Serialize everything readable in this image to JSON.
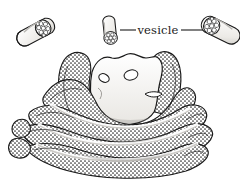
{
  "figure": {
    "style": "stippled pen-and-ink scientific illustration",
    "background_color": "#ffffff",
    "ink_color": "#1a1a1a",
    "width": 240,
    "height": 179
  },
  "labels": [
    {
      "id": "vesicle-label",
      "text": "vesicle",
      "x": 158,
      "y": 33,
      "leader_left": {
        "x1": 120,
        "y1": 30,
        "x2": 136,
        "y2": 30
      },
      "leader_right": {
        "x1": 180,
        "y1": 30,
        "x2": 208,
        "y2": 30
      }
    }
  ],
  "structures": {
    "vesicles": [
      {
        "id": "vesicle-left",
        "cx": 38,
        "cy": 31,
        "rotation": -28,
        "length": 30,
        "width": 17,
        "cap_circles": 10
      },
      {
        "id": "vesicle-middle",
        "cx": 110,
        "cy": 32,
        "rotation": -6,
        "length": 24,
        "width": 14,
        "cap_circles": 9
      },
      {
        "id": "vesicle-right",
        "cx": 218,
        "cy": 29,
        "rotation": 26,
        "length": 30,
        "width": 18,
        "cap_circles": 10
      }
    ],
    "cisternae_count": 6,
    "lumen_vesicles": 3
  },
  "colors": {
    "ink": "#1a1a1a",
    "stipple": "#2b2b2b",
    "lumen_fill": "#f7f6f3",
    "shadow": "#b9b7b3",
    "paper": "#ffffff"
  }
}
